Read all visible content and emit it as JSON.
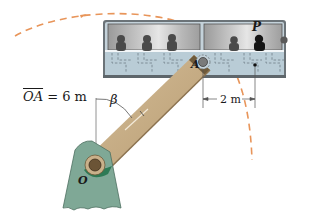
{
  "figure": {
    "type": "mechanics-diagram"
  },
  "labels": {
    "oa_prefix": "OA",
    "oa_suffix": " = 6 m",
    "beta": "β",
    "point_a": "A",
    "point_p": "P",
    "point_o": "O",
    "dimension": "2 m"
  },
  "dimensions": {
    "arm_length": "6 m",
    "offset_A_to_P": "2 m",
    "angle_symbol": "β"
  },
  "colors": {
    "path_dash": "#e8955a",
    "arm_light": "#c9b08a",
    "arm_dark": "#6f5a3a",
    "pedestal": "#7fa896",
    "pedestal_dark": "#2e7a55",
    "gondola_frame": "#6b7378",
    "gondola_window": "#bdbdbd",
    "gondola_panel": "#b9ccd6",
    "passenger": "#4a4a4a",
    "passenger_highlight": "#151515"
  }
}
